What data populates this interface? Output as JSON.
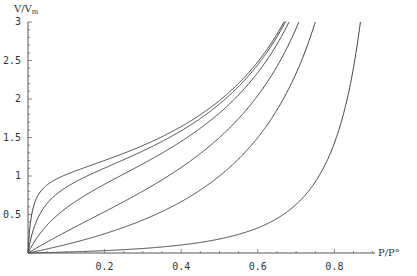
{
  "chart_data": {
    "type": "line",
    "title": "",
    "xlabel": "P/P°",
    "ylabel": "V/Vm",
    "ylabel_main": "V/V",
    "ylabel_sub": "m",
    "xlim": [
      0,
      0.9
    ],
    "ylim": [
      0,
      3
    ],
    "x_ticks": [
      0.2,
      0.4,
      0.6,
      0.8
    ],
    "x_tick_labels": [
      "0.2",
      "0.4",
      "0.6",
      "0.8"
    ],
    "y_ticks": [
      0.5,
      1,
      1.5,
      2,
      2.5,
      3
    ],
    "y_tick_labels": [
      "0.5",
      "1",
      "1.5",
      "2",
      "2.5",
      "3"
    ],
    "grid": false,
    "legend": null,
    "model": "BET isotherm V/Vm = c·x / ((1−x)(1−x+c·x))",
    "series": [
      {
        "name": "c=100",
        "c": 100,
        "x": [
          0.02,
          0.05,
          0.1,
          0.2,
          0.3,
          0.4,
          0.5,
          0.6,
          0.66
        ],
        "values": [
          0.66,
          0.88,
          1.02,
          1.24,
          1.42,
          1.66,
          1.98,
          2.48,
          2.92
        ]
      },
      {
        "name": "c=30",
        "c": 30,
        "x": [
          0.02,
          0.05,
          0.1,
          0.2,
          0.3,
          0.4,
          0.5,
          0.6,
          0.67
        ],
        "values": [
          0.38,
          0.64,
          0.85,
          1.15,
          1.38,
          1.63,
          1.94,
          2.44,
          2.98
        ]
      },
      {
        "name": "c=10",
        "c": 10,
        "x": [
          0.02,
          0.05,
          0.1,
          0.2,
          0.3,
          0.4,
          0.5,
          0.6,
          0.68
        ],
        "values": [
          0.17,
          0.37,
          0.58,
          0.89,
          1.15,
          1.43,
          1.82,
          2.34,
          3.0
        ]
      },
      {
        "name": "c=3",
        "c": 3,
        "x": [
          0.05,
          0.1,
          0.2,
          0.3,
          0.4,
          0.5,
          0.6,
          0.7
        ],
        "values": [
          0.14,
          0.28,
          0.54,
          0.8,
          1.1,
          1.5,
          2.05,
          2.92
        ]
      },
      {
        "name": "c=1",
        "c": 1,
        "x": [
          0.1,
          0.2,
          0.3,
          0.4,
          0.5,
          0.6,
          0.7,
          0.75
        ],
        "values": [
          0.11,
          0.25,
          0.43,
          0.67,
          1.0,
          1.5,
          2.33,
          3.0
        ]
      },
      {
        "name": "c=0.1",
        "c": 0.1,
        "x": [
          0.1,
          0.2,
          0.3,
          0.4,
          0.5,
          0.6,
          0.7,
          0.8,
          0.87
        ],
        "values": [
          0.012,
          0.027,
          0.047,
          0.074,
          0.18,
          0.33,
          0.64,
          1.43,
          3.08
        ]
      }
    ]
  }
}
